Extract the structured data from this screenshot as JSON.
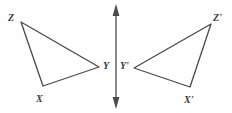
{
  "figure": {
    "background_color": "#fefefe",
    "stroke_color": "#4a4a4a",
    "label_color": "#3a3a3a",
    "width": 232,
    "height": 113
  },
  "mirror_line": {
    "name": "line-of-reflection",
    "orientation": "vertical",
    "x": 116,
    "y_top": 5,
    "y_bottom": 108,
    "arrowheads": "both",
    "stroke_color": "#4a4a4a"
  },
  "triangles": [
    {
      "name": "triangle-xyz",
      "vertices": [
        {
          "label": "Z",
          "point_x": 21,
          "point_y": 22,
          "label_x": 8,
          "label_y": 13
        },
        {
          "label": "Y",
          "point_x": 99,
          "point_y": 67,
          "label_x": 103,
          "label_y": 61
        },
        {
          "label": "X",
          "point_x": 43,
          "point_y": 86,
          "label_x": 36,
          "label_y": 94
        }
      ]
    },
    {
      "name": "triangle-x-prime-y-prime-z-prime",
      "vertices": [
        {
          "label": "Z'",
          "point_x": 211,
          "point_y": 24,
          "label_x": 213,
          "label_y": 13
        },
        {
          "label": "Y'",
          "point_x": 134,
          "point_y": 68,
          "label_x": 120,
          "label_y": 61
        },
        {
          "label": "X'",
          "point_x": 190,
          "point_y": 87,
          "label_x": 184,
          "label_y": 95
        }
      ]
    }
  ]
}
